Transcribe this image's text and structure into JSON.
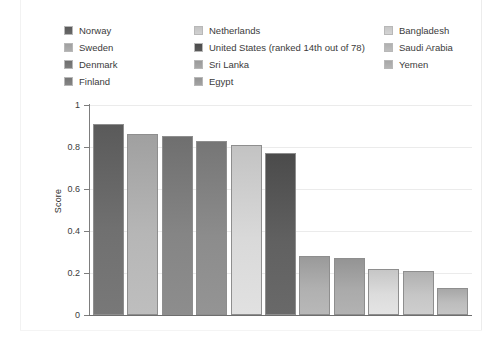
{
  "chart_data": {
    "type": "bar",
    "title": "",
    "xlabel": "",
    "ylabel": "Score",
    "ylim": [
      0,
      1
    ],
    "yticks": [
      "0",
      "0.2",
      "0.4",
      "0.6",
      "0.8",
      "1"
    ],
    "grid": true,
    "legend_position": "top",
    "categories": [
      "Norway",
      "Sweden",
      "Denmark",
      "Finland",
      "Netherlands",
      "United States (ranked 14th out of 78)",
      "Sri Lanka",
      "Egypt",
      "Bangladesh",
      "Saudi Arabia",
      "Yemen"
    ],
    "values": [
      0.91,
      0.86,
      0.85,
      0.83,
      0.81,
      0.77,
      0.28,
      0.27,
      0.22,
      0.21,
      0.13
    ],
    "colors": [
      "#5a5a5a",
      "#a0a0a0",
      "#6f6f6f",
      "#767676",
      "#c3c3c3",
      "#4b4b4b",
      "#9a9a9a",
      "#949494",
      "#c6c6c6",
      "#b0b0b0",
      "#a7a7a7"
    ]
  },
  "legend": {
    "columns": [
      {
        "items": [
          {
            "label": "Norway",
            "color": "#5a5a5a"
          },
          {
            "label": "Sweden",
            "color": "#a0a0a0"
          },
          {
            "label": "Denmark",
            "color": "#6f6f6f"
          },
          {
            "label": "Finland",
            "color": "#767676"
          }
        ]
      },
      {
        "items": [
          {
            "label": "Netherlands",
            "color": "#c3c3c3"
          },
          {
            "label": "United States (ranked 14th out of 78)",
            "color": "#4b4b4b"
          },
          {
            "label": "Sri Lanka",
            "color": "#9a9a9a"
          },
          {
            "label": "Egypt",
            "color": "#949494"
          }
        ]
      },
      {
        "items": [
          {
            "label": "Bangladesh",
            "color": "#c6c6c6"
          },
          {
            "label": "Saudi Arabia",
            "color": "#b0b0b0"
          },
          {
            "label": "Yemen",
            "color": "#a7a7a7"
          }
        ]
      }
    ]
  }
}
